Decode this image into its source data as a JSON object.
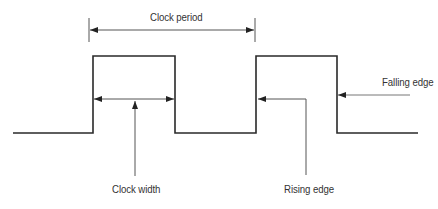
{
  "diagram": {
    "labels": {
      "clock_period": "Clock period",
      "clock_width": "Clock width",
      "rising_edge": "Rising edge",
      "falling_edge": "Falling edge"
    },
    "colors": {
      "waveform": "#2a2a2a",
      "annotation": "#555555",
      "arrowhead": "#222222",
      "text": "#333333",
      "background": "#ffffff"
    },
    "waveform": {
      "low_y": 133,
      "high_y": 56,
      "points": [
        [
          13,
          133
        ],
        [
          93,
          133
        ],
        [
          93,
          56
        ],
        [
          175,
          56
        ],
        [
          175,
          133
        ],
        [
          256,
          133
        ],
        [
          256,
          56
        ],
        [
          337,
          56
        ],
        [
          337,
          133
        ],
        [
          418,
          133
        ]
      ]
    },
    "annotations": {
      "clock_period": {
        "from_x": 89,
        "to_x": 255,
        "y": 30,
        "tick_top": 18,
        "tick_bottom": 42
      },
      "clock_width": {
        "from_x": 94,
        "to_x": 174,
        "y": 99,
        "pointer_x": 135,
        "pointer_top": 101,
        "pointer_bottom": 176
      },
      "rising_edge": {
        "tip_x": 257,
        "y": 99,
        "corner_x": 306,
        "bottom_y": 175
      },
      "falling_edge": {
        "tip_x": 338,
        "from_x": 410,
        "y": 95
      }
    }
  }
}
